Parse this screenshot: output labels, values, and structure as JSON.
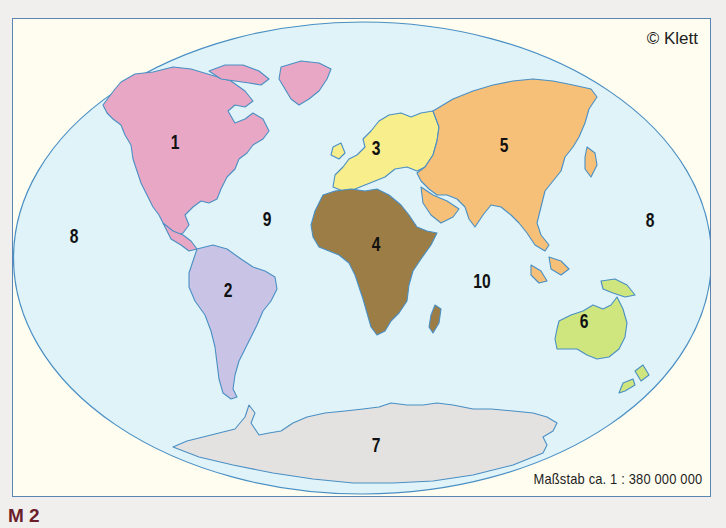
{
  "figure": {
    "label": "M 2",
    "copyright": "© Klett",
    "scale": "Maßstab ca. 1 : 380 000 000"
  },
  "colors": {
    "background": "#f1efee",
    "frame_fill": "#fefdf0",
    "frame_border": "#5a86b3",
    "ocean": "#dff3f8",
    "coastline": "#4a8fc4",
    "north_america": "#e8a7c4",
    "south_america": "#c9c4e6",
    "europe": "#f9ee8c",
    "africa": "#9c7d45",
    "asia": "#f6c078",
    "australia": "#cfe67f",
    "antarctica": "#e3e2e0",
    "figure_label": "#6b1e2a"
  },
  "map": {
    "title": "World map with numbered continents and oceans",
    "labels": [
      {
        "id": "1",
        "text": "1",
        "region": "North America",
        "x": 174,
        "y": 141
      },
      {
        "id": "2",
        "text": "2",
        "region": "South America",
        "x": 227,
        "y": 289
      },
      {
        "id": "3",
        "text": "3",
        "region": "Europe",
        "x": 375,
        "y": 147
      },
      {
        "id": "4",
        "text": "4",
        "region": "Africa",
        "x": 375,
        "y": 243
      },
      {
        "id": "5",
        "text": "5",
        "region": "Asia",
        "x": 503,
        "y": 144
      },
      {
        "id": "6",
        "text": "6",
        "region": "Australia",
        "x": 583,
        "y": 320
      },
      {
        "id": "7",
        "text": "7",
        "region": "Antarctica",
        "x": 375,
        "y": 444
      },
      {
        "id": "8a",
        "text": "8",
        "region": "Pacific Ocean (west)",
        "x": 73,
        "y": 235
      },
      {
        "id": "8b",
        "text": "8",
        "region": "Pacific Ocean (east)",
        "x": 649,
        "y": 219
      },
      {
        "id": "9",
        "text": "9",
        "region": "Atlantic Ocean",
        "x": 266,
        "y": 218
      },
      {
        "id": "10",
        "text": "10",
        "region": "Indian Ocean",
        "x": 481,
        "y": 280
      }
    ]
  }
}
